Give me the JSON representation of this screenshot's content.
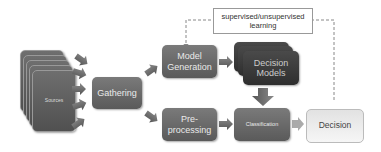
{
  "diagram": {
    "sources_label": "Sources",
    "gathering_label": "Gathering",
    "model_generation_label": "Model\nGeneration",
    "preprocessing_label": "Pre-\nprocessing",
    "decision_models_label": "Decision\nModels",
    "classification_label": "Classification",
    "decision_label": "Decision",
    "feedback_label": "supervised/unsupervised\nlearning"
  },
  "colors": {
    "box_dark": "#5f5f5f",
    "box_darker": "#333333",
    "arrow": "#6a6a6a",
    "decision_box": "#eeeeee"
  }
}
